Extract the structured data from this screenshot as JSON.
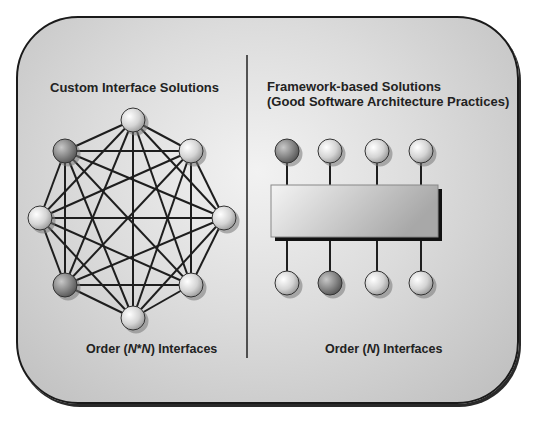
{
  "left_panel": {
    "title": "Custom Interface Solutions",
    "caption_prefix": "Order (",
    "caption_var1": "N",
    "caption_op": "*",
    "caption_var2": "N",
    "caption_suffix": ") Interfaces",
    "nodes": [
      {
        "id": "top",
        "x": 133,
        "y": 120,
        "shade": "light"
      },
      {
        "id": "top-left",
        "x": 65,
        "y": 151,
        "shade": "dark"
      },
      {
        "id": "top-right",
        "x": 191,
        "y": 151,
        "shade": "light"
      },
      {
        "id": "left",
        "x": 40,
        "y": 218,
        "shade": "light"
      },
      {
        "id": "right",
        "x": 224,
        "y": 218,
        "shade": "light"
      },
      {
        "id": "bottom-left",
        "x": 65,
        "y": 285,
        "shade": "dark"
      },
      {
        "id": "bottom-right",
        "x": 191,
        "y": 285,
        "shade": "light"
      },
      {
        "id": "bottom",
        "x": 133,
        "y": 318,
        "shade": "light"
      }
    ],
    "topology": "fully-connected"
  },
  "right_panel": {
    "title_line1": "Framework-based Solutions",
    "title_line2": "(Good Software Architecture Practices)",
    "caption_prefix": "Order (",
    "caption_var": "N",
    "caption_suffix": ") Interfaces",
    "top_nodes": [
      {
        "x": 287,
        "shade": "dark"
      },
      {
        "x": 330,
        "shade": "light"
      },
      {
        "x": 377,
        "shade": "light"
      },
      {
        "x": 421,
        "shade": "light"
      }
    ],
    "bottom_nodes": [
      {
        "x": 287,
        "shade": "light"
      },
      {
        "x": 330,
        "shade": "dark"
      },
      {
        "x": 377,
        "shade": "light"
      },
      {
        "x": 421,
        "shade": "light"
      }
    ],
    "framework_box": "framework"
  }
}
